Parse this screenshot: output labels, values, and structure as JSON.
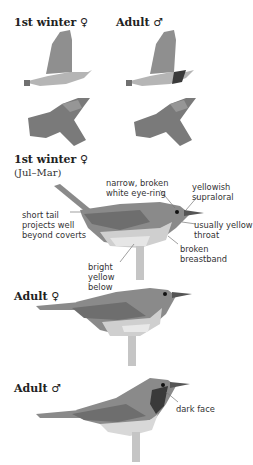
{
  "headings": {
    "flight_female": "1st winter ♀",
    "flight_male": "Adult ♂",
    "perched_first_winter": "1st winter ♀",
    "perched_first_winter_period": "(Jul–Mar)",
    "perched_adult_female": "Adult ♀",
    "perched_adult_male": "Adult ♂"
  },
  "annotations": {
    "eye_ring": "narrow, broken\nwhite eye-ring",
    "supraloral": "yellowish\nsupraloral",
    "tail": "short tail\nprojects well\nbeyond coverts",
    "throat": "usually yellow\nthroat",
    "breastband": "broken\nbreastband",
    "below": "bright\nyellow\nbelow",
    "dark_face": "dark face"
  },
  "colors": {
    "bird_upper": "#8a8a8a",
    "bird_wing": "#6e6e6e",
    "bird_under": "#c8c8c8",
    "bird_pale": "#e4e4e4",
    "dark_face": "#3a3a3a",
    "leader_line": "#777777"
  }
}
